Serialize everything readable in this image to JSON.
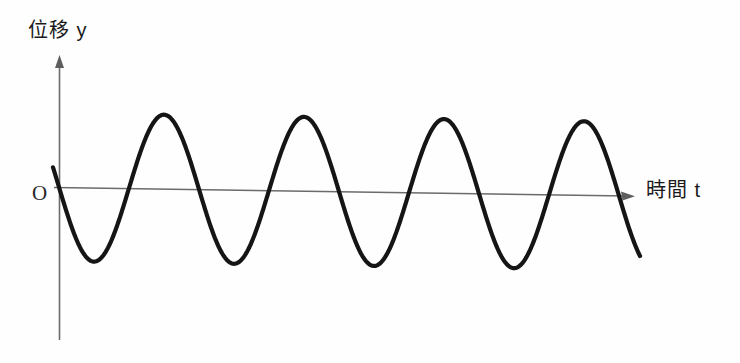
{
  "figure": {
    "background_color": "#fefefe",
    "curve_color": "#151515",
    "axis_color": "#6b6b6b"
  },
  "labels": {
    "y_axis": "位移 y",
    "t_axis": "時間 t",
    "origin": "O"
  },
  "chart_data": {
    "type": "line",
    "title": "",
    "subtitle": "",
    "xlabel": "時間 t",
    "ylabel": "位移 y",
    "grid": false,
    "legend": null,
    "annotations": [
      {
        "name": "origin",
        "text": "O",
        "x": 0,
        "y": 0
      }
    ],
    "axes": {
      "x_axis_arrow": true,
      "y_axis_arrow": true,
      "x_tick_labels": [],
      "y_tick_labels": [],
      "xlim": [
        0,
        4.15
      ],
      "ylim": [
        -1.15,
        1.15
      ]
    },
    "series": [
      {
        "name": "displacement",
        "form": "negative sine",
        "amplitude": 1,
        "period": 1,
        "cycles": 4.15,
        "phase": "starts at origin moving downward",
        "x": [
          0,
          0.25,
          0.5,
          0.75,
          1,
          1.25,
          1.5,
          1.75,
          2,
          2.25,
          2.5,
          2.75,
          3,
          3.25,
          3.5,
          3.75,
          4,
          4.15
        ],
        "values": [
          0,
          -1,
          0,
          1,
          0,
          -1,
          0,
          1,
          0,
          -1,
          0,
          1,
          0,
          -1,
          0,
          1,
          0,
          -0.55
        ]
      }
    ],
    "peaks": [
      {
        "x": 0.75,
        "y": 1
      },
      {
        "x": 1.75,
        "y": 1
      },
      {
        "x": 2.75,
        "y": 1
      },
      {
        "x": 3.75,
        "y": 1
      }
    ],
    "troughs": [
      {
        "x": 0.25,
        "y": -1
      },
      {
        "x": 1.25,
        "y": -1
      },
      {
        "x": 2.25,
        "y": -1
      },
      {
        "x": 3.25,
        "y": -1
      }
    ]
  },
  "geometry": {
    "y_axis_x": 59,
    "y_axis_top": 58,
    "y_axis_bottom": 340,
    "t_axis_left_x": 54,
    "t_axis_right_x": 633,
    "t_axis_left_y": 187,
    "t_axis_right_y": 196,
    "wave_start": {
      "x": 53,
      "y": 168
    },
    "wave_end": {
      "x": 640,
      "y": 236
    },
    "period_px": 140,
    "amplitude_px": 74
  }
}
